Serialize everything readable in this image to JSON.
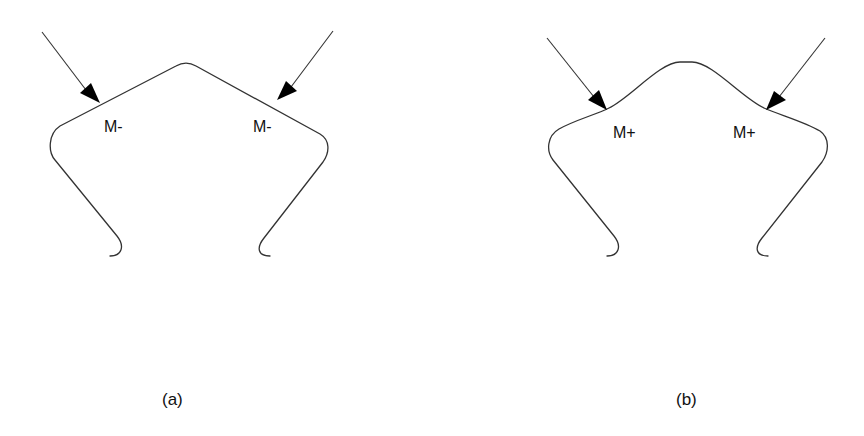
{
  "figure": {
    "panels": [
      {
        "id": "a",
        "caption": "(a)",
        "shape": "peaked-vertex (angular apex, straight sides)",
        "left_label": "M-",
        "right_label": "M-"
      },
      {
        "id": "b",
        "caption": "(b)",
        "shape": "rounded-bump (smooth apex, inflected sides)",
        "left_label": "M+",
        "right_label": "M+"
      }
    ],
    "colors": {
      "line": "#333333",
      "arrow": "#000000",
      "text": "#111111",
      "background": "#ffffff"
    }
  }
}
